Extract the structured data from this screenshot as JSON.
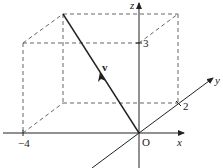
{
  "diagram": {
    "type": "3d-vector",
    "origin_label": "O",
    "axes": {
      "x": {
        "label": "x",
        "tick_label": "-4",
        "tick_value": -4
      },
      "y": {
        "label": "y",
        "tick_label": "2",
        "tick_value": 2
      },
      "z": {
        "label": "z",
        "tick_label": "3",
        "tick_value": 3
      }
    },
    "vector": {
      "label": "v",
      "components": [
        -4,
        2,
        3
      ]
    },
    "colors": {
      "axis": "#222222",
      "dashed": "#555555",
      "vector": "#222222"
    }
  }
}
